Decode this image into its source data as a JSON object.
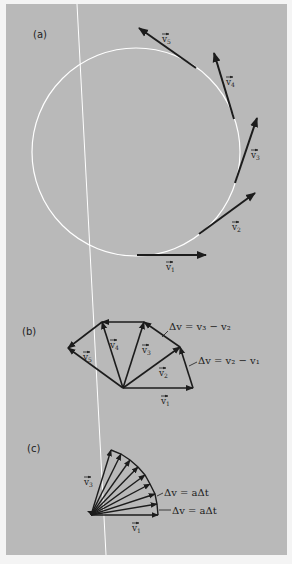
{
  "figure": {
    "background_color": "#b9b9b9",
    "page_color": "#f4f4f4",
    "arrow_color": "#1c1c1c",
    "circle_color": "#ffffff"
  },
  "part_a": {
    "label": "(a)",
    "vectors": [
      {
        "name": "v1",
        "label": "v⃗1",
        "text": "v",
        "sub": "1"
      },
      {
        "name": "v2",
        "label": "v⃗2",
        "text": "v",
        "sub": "2"
      },
      {
        "name": "v3",
        "label": "v⃗3",
        "text": "v",
        "sub": "3"
      },
      {
        "name": "v4",
        "label": "v⃗4",
        "text": "v",
        "sub": "4"
      },
      {
        "name": "v5",
        "label": "v⃗5",
        "text": "v",
        "sub": "5"
      }
    ]
  },
  "part_b": {
    "label": "(b)",
    "vectors": [
      {
        "text": "v",
        "sub": "1"
      },
      {
        "text": "v",
        "sub": "2"
      },
      {
        "text": "v",
        "sub": "3"
      },
      {
        "text": "v",
        "sub": "4"
      },
      {
        "text": "v",
        "sub": "5"
      }
    ],
    "equations": [
      {
        "text": "Δv = v₃ − v₂"
      },
      {
        "text": "Δv = v₂ − v₁"
      }
    ]
  },
  "part_c": {
    "label": "(c)",
    "vectors": [
      {
        "text": "v",
        "sub": "1"
      },
      {
        "text": "v",
        "sub": "3"
      }
    ],
    "equations": [
      {
        "text": "Δv = aΔt"
      },
      {
        "text": "Δv = aΔt"
      }
    ]
  }
}
